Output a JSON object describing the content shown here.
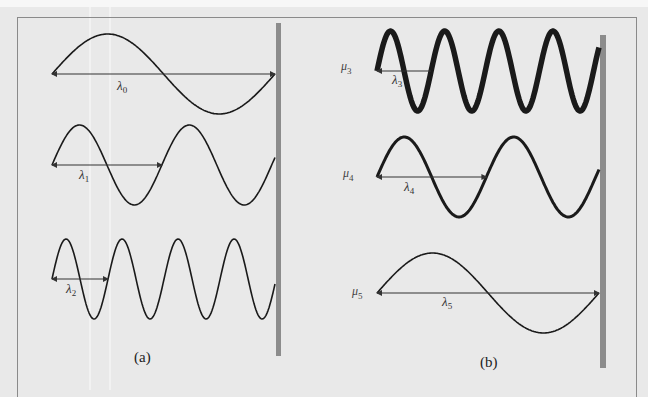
{
  "figure": {
    "panels": [
      {
        "id": "a",
        "caption": "(a)",
        "waves": [
          {
            "name": "wave-0",
            "wavelength_label": "λ",
            "wavelength_sub": "0",
            "cycles": 1.0,
            "weight": "thin"
          },
          {
            "name": "wave-1",
            "wavelength_label": "λ",
            "wavelength_sub": "1",
            "cycles": 2.03,
            "weight": "thin"
          },
          {
            "name": "wave-2",
            "wavelength_label": "λ",
            "wavelength_sub": "2",
            "cycles": 3.98,
            "weight": "thin"
          }
        ]
      },
      {
        "id": "b",
        "caption": "(b)",
        "waves": [
          {
            "name": "wave-3",
            "density_label": "μ",
            "density_sub": "3",
            "wavelength_label": "λ",
            "wavelength_sub": "3",
            "cycles": 4.1,
            "weight": "thick"
          },
          {
            "name": "wave-4",
            "density_label": "μ",
            "density_sub": "4",
            "wavelength_label": "λ",
            "wavelength_sub": "4",
            "cycles": 2.03,
            "weight": "medium"
          },
          {
            "name": "wave-5",
            "density_label": "μ",
            "density_sub": "5",
            "wavelength_label": "λ",
            "wavelength_sub": "5",
            "cycles": 1.0,
            "weight": "thin"
          }
        ]
      }
    ],
    "colors": {
      "wave": "#1a1a1a",
      "wall": "#8c8c8c",
      "arrow": "#333333"
    }
  }
}
